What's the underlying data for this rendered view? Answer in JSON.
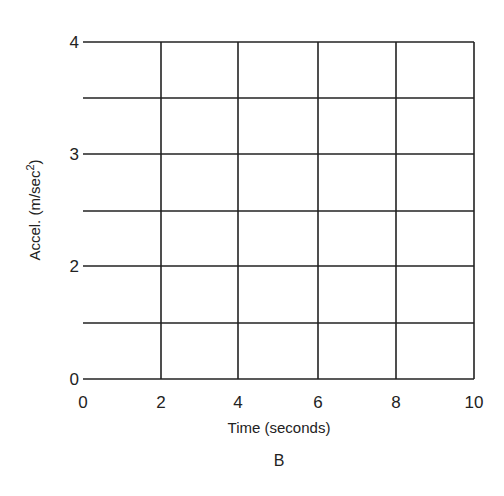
{
  "chart_data": {
    "type": "line",
    "title": "",
    "panel_label": "B",
    "xlabel": "Time (seconds)",
    "ylabel": "Accel. (m/sec",
    "ylabel_superscript": "2",
    "ylabel_close": ")",
    "xlim": [
      0,
      10
    ],
    "ylim": [
      0,
      4
    ],
    "x_ticks": [
      0,
      2,
      4,
      6,
      8,
      10
    ],
    "x_tick_labels": [
      "0",
      "2",
      "4",
      "6",
      "8",
      "10"
    ],
    "y_gridlines": [
      0,
      0.67,
      1.33,
      2,
      2.67,
      3.33,
      4
    ],
    "y_tick_labels": [
      {
        "label": "4",
        "line_index": 6
      },
      {
        "label": "3",
        "line_index": 4
      },
      {
        "label": "2",
        "line_index": 2
      },
      {
        "label": "0",
        "line_index": 0
      }
    ],
    "grid": true,
    "series": [],
    "note": "Empty grid for plotting; no data points drawn"
  },
  "layout": {
    "plot_left": 83,
    "plot_right": 474,
    "plot_top": 42,
    "plot_bottom": 379,
    "vertical_line_x": [
      161,
      238,
      318,
      396,
      474
    ],
    "horizontal_line_y": [
      379,
      323,
      266,
      211,
      154,
      98,
      42
    ]
  }
}
